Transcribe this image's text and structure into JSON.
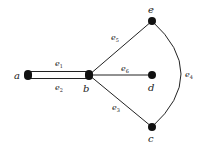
{
  "graph": {
    "colors": {
      "edge": "#222222",
      "node": "#111111",
      "text": "#1a1a1a",
      "background": "#ffffff"
    },
    "nodes": [
      {
        "id": "a",
        "label": "a",
        "x": 28,
        "y": 75
      },
      {
        "id": "b",
        "label": "b",
        "x": 89,
        "y": 75
      },
      {
        "id": "e",
        "label": "e",
        "x": 152,
        "y": 21
      },
      {
        "id": "d",
        "label": "d",
        "x": 152,
        "y": 75
      },
      {
        "id": "c",
        "label": "c",
        "x": 152,
        "y": 127
      }
    ],
    "edges": [
      {
        "id": "e1",
        "label": "e",
        "sub": "1",
        "from": "a",
        "to": "b"
      },
      {
        "id": "e2",
        "label": "e",
        "sub": "2",
        "from": "a",
        "to": "b"
      },
      {
        "id": "e5",
        "label": "e",
        "sub": "5",
        "from": "b",
        "to": "e"
      },
      {
        "id": "e6",
        "label": "e",
        "sub": "6",
        "from": "b",
        "to": "d"
      },
      {
        "id": "e3",
        "label": "e",
        "sub": "3",
        "from": "b",
        "to": "c"
      },
      {
        "id": "e4",
        "label": "e",
        "sub": "4",
        "from": "e",
        "to": "c"
      }
    ]
  }
}
